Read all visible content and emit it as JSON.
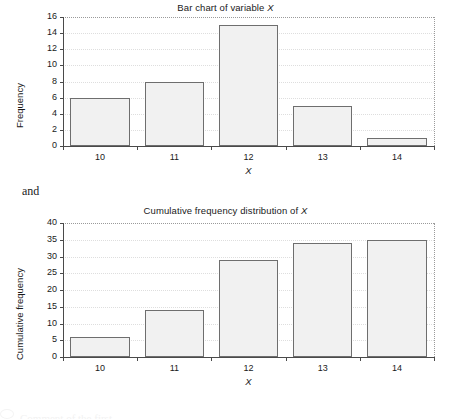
{
  "page": {
    "connector_text": "and",
    "footer_text": "Comment of the first..."
  },
  "charts": [
    {
      "id": "bar-chart-frequency",
      "title_prefix": "Bar chart of variable ",
      "title_var": "X",
      "ylabel": "Frequency",
      "xlabel": "X",
      "yticks": [
        "0",
        "2",
        "4",
        "6",
        "8",
        "10",
        "12",
        "14",
        "16"
      ],
      "xticks": [
        "10",
        "11",
        "12",
        "13",
        "14"
      ]
    },
    {
      "id": "bar-chart-cumulative",
      "title_prefix": "Cumulative frequency distribution of ",
      "title_var": "X",
      "ylabel": "Cumulative frequency",
      "xlabel": "X",
      "yticks": [
        "0",
        "5",
        "10",
        "15",
        "20",
        "25",
        "30",
        "35",
        "40"
      ],
      "xticks": [
        "10",
        "11",
        "12",
        "13",
        "14"
      ]
    }
  ],
  "chart_data": [
    {
      "type": "bar",
      "title": "Bar chart of variable X",
      "xlabel": "X",
      "ylabel": "Frequency",
      "categories": [
        10,
        11,
        12,
        13,
        14
      ],
      "values": [
        6,
        8,
        15,
        5,
        1
      ],
      "ylim": [
        0,
        16
      ],
      "ytick_step": 2,
      "grid": true,
      "legend": false,
      "bar_fill": "#f1f1f1",
      "bar_edge": "#6e6e6e"
    },
    {
      "type": "bar",
      "title": "Cumulative frequency distribution of X",
      "xlabel": "X",
      "ylabel": "Cumulative frequency",
      "categories": [
        10,
        11,
        12,
        13,
        14
      ],
      "values": [
        6,
        14,
        29,
        34,
        35
      ],
      "ylim": [
        0,
        40
      ],
      "ytick_step": 5,
      "grid": true,
      "legend": false,
      "bar_fill": "#f1f1f1",
      "bar_edge": "#6e6e6e"
    }
  ]
}
